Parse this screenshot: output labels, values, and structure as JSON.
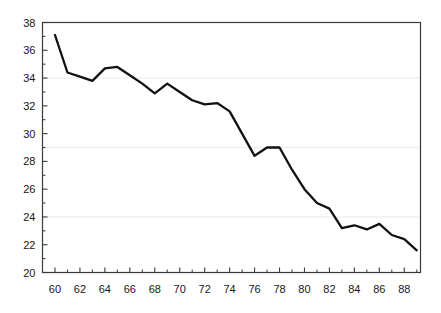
{
  "chart_data": {
    "type": "line",
    "title": "",
    "subtitle": "",
    "xlabel": "",
    "ylabel": "",
    "xlim": [
      59.0,
      89.3
    ],
    "ylim": [
      20,
      38
    ],
    "grid": "faint horizontal gridlines at 34, 29, 24",
    "legend": "none",
    "series": [
      {
        "name": "series-1",
        "x": [
          60,
          61,
          62,
          63,
          64,
          65,
          66,
          67,
          68,
          69,
          70,
          71,
          72,
          73,
          74,
          75,
          76,
          77,
          78,
          79,
          80,
          81,
          82,
          83,
          84,
          85,
          86,
          87,
          88,
          89
        ],
        "values": [
          37.1,
          34.4,
          34.1,
          33.8,
          34.7,
          34.8,
          34.2,
          33.6,
          32.9,
          33.6,
          33.0,
          32.4,
          32.1,
          32.2,
          31.6,
          30.0,
          28.4,
          29.0,
          29.0,
          27.4,
          26.0,
          25.0,
          24.6,
          23.2,
          23.4,
          23.1,
          23.5,
          22.7,
          22.4,
          21.6
        ]
      }
    ],
    "x_ticks_major": [
      60,
      62,
      64,
      66,
      68,
      70,
      72,
      74,
      76,
      78,
      80,
      82,
      84,
      86,
      88
    ],
    "x_ticks_minor": [
      61,
      63,
      65,
      67,
      69,
      71,
      73,
      75,
      77,
      79,
      81,
      83,
      85,
      87,
      89
    ],
    "y_ticks": [
      20,
      22,
      24,
      26,
      28,
      30,
      32,
      34,
      36,
      38
    ],
    "x_tick_labels": [
      "60",
      "62",
      "64",
      "66",
      "68",
      "70",
      "72",
      "74",
      "76",
      "78",
      "80",
      "82",
      "84",
      "86",
      "88"
    ],
    "y_tick_labels": [
      "20",
      "22",
      "24",
      "26",
      "28",
      "30",
      "32",
      "34",
      "36",
      "38"
    ],
    "line_color": "#111111",
    "frame_color": "#3a3a3a",
    "gridline_color": "#f2f0ee",
    "background_color": "#ffffff"
  }
}
